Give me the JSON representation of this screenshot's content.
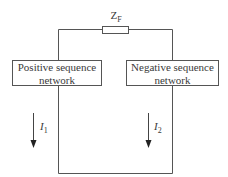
{
  "impedance": {
    "symbol": "Z",
    "subscript": "F"
  },
  "networks": {
    "positive": {
      "line1": "Positive sequence",
      "line2": "network"
    },
    "negative": {
      "line1": "Negative sequence",
      "line2": "network"
    }
  },
  "currents": [
    {
      "symbol": "I",
      "subscript": "1"
    },
    {
      "symbol": "I",
      "subscript": "2"
    }
  ],
  "colors": {
    "line": "#555555",
    "text": "#3a3a3a",
    "background": "#ffffff"
  }
}
